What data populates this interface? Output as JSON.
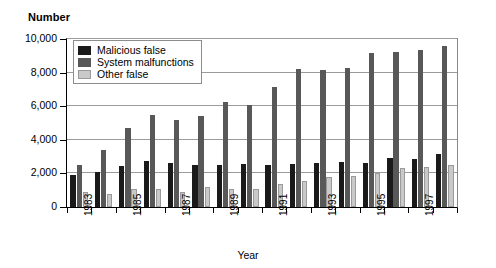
{
  "chart_data": {
    "type": "bar",
    "title": "",
    "ylabel": "Number",
    "xlabel": "Year",
    "ylim": [
      0,
      10000
    ],
    "yticks": [
      0,
      2000,
      4000,
      6000,
      8000,
      10000
    ],
    "ytick_labels": [
      "0",
      "2,000",
      "4,000",
      "6,000",
      "8,000",
      "10,000"
    ],
    "grid": true,
    "legend_position": "upper left",
    "categories": [
      "1983",
      "1984",
      "1985",
      "1986",
      "1987",
      "1988",
      "1989",
      "1990",
      "1991",
      "1992",
      "1993",
      "1994",
      "1995",
      "1996",
      "1997",
      "1998"
    ],
    "xtick_labels": [
      "1983",
      "",
      "1985",
      "",
      "1987",
      "",
      "1989",
      "",
      "1991",
      "",
      "1993",
      "",
      "1995",
      "",
      "1997",
      ""
    ],
    "series": [
      {
        "name": "Malicious false",
        "color": "#1a1a1a",
        "values": [
          1900,
          2100,
          2450,
          2750,
          2600,
          2500,
          2500,
          2550,
          2500,
          2550,
          2600,
          2650,
          2600,
          2900,
          2850,
          3150
        ]
      },
      {
        "name": "System malfunctions",
        "color": "#585858",
        "values": [
          2500,
          3400,
          4700,
          5450,
          5200,
          5400,
          6250,
          6050,
          7150,
          8200,
          8150,
          8300,
          9150,
          9250,
          9350,
          9600
        ]
      },
      {
        "name": "Other false",
        "color": "#c9c9c9",
        "values": [
          900,
          800,
          1100,
          1050,
          900,
          1200,
          1100,
          1100,
          1350,
          1550,
          1800,
          1850,
          2050,
          2300,
          2400,
          2500
        ]
      }
    ]
  }
}
